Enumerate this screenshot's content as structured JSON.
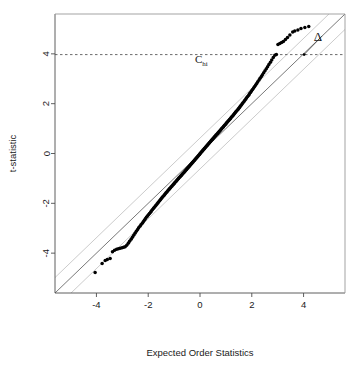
{
  "chart_data": {
    "type": "scatter",
    "title": "",
    "xlabel": "Expected Order Statistics",
    "ylabel": "t-statistic",
    "xlim": [
      -5.6,
      5.6
    ],
    "ylim": [
      -5.6,
      5.6
    ],
    "grid": false,
    "legend": null,
    "xticks": [
      -4,
      -2,
      0,
      2,
      4
    ],
    "xtick_labels": [
      "-4",
      "-2",
      "0",
      "2",
      "4"
    ],
    "yticks": [
      -4,
      -2,
      0,
      2,
      4
    ],
    "ytick_labels": [
      "-4",
      "-2",
      "0",
      "2",
      "4"
    ],
    "annotations": [
      {
        "name": "c-hi-label",
        "text": "C",
        "subscript": "hi",
        "x": 0.05,
        "y": 3.62
      },
      {
        "name": "delta-label",
        "text": "Δ",
        "x": 4.55,
        "y": 4.52
      }
    ],
    "reference_lines": [
      {
        "name": "identity-line",
        "type": "abline",
        "intercept": 0.0,
        "slope": 1.0,
        "color": "#555555",
        "style": "solid"
      },
      {
        "name": "upper-band-line",
        "type": "abline",
        "intercept": 0.62,
        "slope": 1.0,
        "color": "#b5b5b5",
        "style": "solid"
      },
      {
        "name": "lower-band-line",
        "type": "abline",
        "intercept": -0.62,
        "slope": 1.0,
        "color": "#b5b5b5",
        "style": "solid"
      },
      {
        "name": "c-hi-threshold",
        "type": "hline",
        "y": 3.97,
        "color": "#444444",
        "style": "dashed"
      }
    ],
    "series": [
      {
        "name": "qq-points",
        "marker": "filled-circle",
        "color": "#000000",
        "x": [
          -4.05,
          -3.78,
          -3.66,
          -3.58,
          -3.47,
          -3.38,
          -3.3,
          -3.22,
          -3.15,
          -3.08,
          -3.01,
          -2.95,
          -2.89,
          -2.83,
          -2.77,
          -2.72,
          -2.66,
          -2.61,
          -2.56,
          -2.51,
          -2.46,
          -2.41,
          -2.37,
          -2.32,
          -2.28,
          -2.23,
          -2.19,
          -2.15,
          -2.11,
          -2.07,
          -2.03,
          -1.99,
          -1.95,
          -1.91,
          -1.88,
          -1.84,
          -1.8,
          -1.77,
          -1.73,
          -1.7,
          -1.66,
          -1.63,
          -1.6,
          -1.56,
          -1.53,
          -1.5,
          -1.47,
          -1.44,
          -1.4,
          -1.37,
          -1.34,
          -1.31,
          -1.28,
          -1.25,
          -1.22,
          -1.19,
          -1.17,
          -1.14,
          -1.11,
          -1.08,
          -1.05,
          -1.02,
          -1.0,
          -0.97,
          -0.94,
          -0.91,
          -0.89,
          -0.86,
          -0.83,
          -0.81,
          -0.78,
          -0.75,
          -0.73,
          -0.7,
          -0.68,
          -0.65,
          -0.62,
          -0.6,
          -0.57,
          -0.55,
          -0.52,
          -0.5,
          -0.47,
          -0.45,
          -0.42,
          -0.4,
          -0.37,
          -0.35,
          -0.32,
          -0.3,
          -0.27,
          -0.25,
          -0.22,
          -0.2,
          -0.17,
          -0.15,
          -0.12,
          -0.1,
          -0.07,
          -0.05,
          -0.02,
          0.0,
          0.02,
          0.05,
          0.07,
          0.1,
          0.12,
          0.15,
          0.17,
          0.2,
          0.22,
          0.25,
          0.27,
          0.3,
          0.32,
          0.35,
          0.37,
          0.4,
          0.42,
          0.45,
          0.47,
          0.5,
          0.52,
          0.55,
          0.57,
          0.6,
          0.62,
          0.65,
          0.68,
          0.7,
          0.73,
          0.75,
          0.78,
          0.81,
          0.83,
          0.86,
          0.89,
          0.91,
          0.94,
          0.97,
          1.0,
          1.02,
          1.05,
          1.08,
          1.11,
          1.14,
          1.17,
          1.19,
          1.22,
          1.25,
          1.28,
          1.31,
          1.34,
          1.37,
          1.4,
          1.44,
          1.47,
          1.5,
          1.53,
          1.56,
          1.6,
          1.63,
          1.66,
          1.7,
          1.73,
          1.77,
          1.8,
          1.84,
          1.88,
          1.91,
          1.95,
          1.99,
          2.03,
          2.07,
          2.11,
          2.15,
          2.19,
          2.23,
          2.28,
          2.32,
          2.37,
          2.41,
          2.46,
          2.51,
          2.56,
          2.61,
          2.66,
          2.72,
          2.77,
          2.83,
          2.89,
          2.95,
          3.01,
          3.08,
          3.15,
          3.22,
          3.3,
          3.38,
          3.47,
          3.58,
          3.66,
          3.78,
          3.9,
          4.05,
          4.2
        ],
        "y": [
          -4.78,
          -4.42,
          -4.3,
          -4.26,
          -4.22,
          -3.94,
          -3.88,
          -3.84,
          -3.82,
          -3.8,
          -3.78,
          -3.76,
          -3.74,
          -3.68,
          -3.6,
          -3.52,
          -3.44,
          -3.36,
          -3.28,
          -3.2,
          -3.12,
          -3.05,
          -2.98,
          -2.92,
          -2.86,
          -2.8,
          -2.74,
          -2.68,
          -2.62,
          -2.56,
          -2.51,
          -2.46,
          -2.41,
          -2.36,
          -2.31,
          -2.26,
          -2.21,
          -2.17,
          -2.12,
          -2.08,
          -2.03,
          -1.99,
          -1.95,
          -1.9,
          -1.86,
          -1.82,
          -1.78,
          -1.74,
          -1.7,
          -1.66,
          -1.62,
          -1.58,
          -1.55,
          -1.51,
          -1.47,
          -1.44,
          -1.4,
          -1.37,
          -1.33,
          -1.3,
          -1.26,
          -1.23,
          -1.2,
          -1.16,
          -1.13,
          -1.1,
          -1.07,
          -1.03,
          -1.0,
          -0.97,
          -0.94,
          -0.91,
          -0.88,
          -0.85,
          -0.82,
          -0.79,
          -0.76,
          -0.73,
          -0.7,
          -0.67,
          -0.64,
          -0.61,
          -0.58,
          -0.55,
          -0.52,
          -0.49,
          -0.46,
          -0.43,
          -0.4,
          -0.37,
          -0.34,
          -0.31,
          -0.28,
          -0.25,
          -0.22,
          -0.19,
          -0.16,
          -0.13,
          -0.1,
          -0.07,
          -0.04,
          -0.01,
          0.02,
          0.05,
          0.08,
          0.11,
          0.14,
          0.17,
          0.2,
          0.23,
          0.26,
          0.29,
          0.32,
          0.35,
          0.38,
          0.41,
          0.44,
          0.47,
          0.5,
          0.53,
          0.56,
          0.59,
          0.62,
          0.65,
          0.68,
          0.71,
          0.74,
          0.77,
          0.8,
          0.83,
          0.86,
          0.89,
          0.92,
          0.96,
          0.99,
          1.02,
          1.05,
          1.08,
          1.12,
          1.15,
          1.18,
          1.22,
          1.25,
          1.29,
          1.32,
          1.36,
          1.39,
          1.43,
          1.47,
          1.5,
          1.54,
          1.58,
          1.62,
          1.66,
          1.7,
          1.74,
          1.78,
          1.82,
          1.86,
          1.91,
          1.95,
          2.0,
          2.04,
          2.09,
          2.14,
          2.19,
          2.24,
          2.29,
          2.34,
          2.4,
          2.45,
          2.51,
          2.57,
          2.63,
          2.69,
          2.75,
          2.81,
          2.88,
          2.95,
          3.02,
          3.09,
          3.16,
          3.24,
          3.32,
          3.4,
          3.48,
          3.57,
          3.66,
          3.75,
          3.85,
          3.94,
          3.97,
          4.38,
          4.42,
          4.46,
          4.5,
          4.58,
          4.66,
          4.76,
          4.88,
          4.92,
          4.96,
          5.02,
          5.06,
          5.1
        ]
      }
    ]
  }
}
